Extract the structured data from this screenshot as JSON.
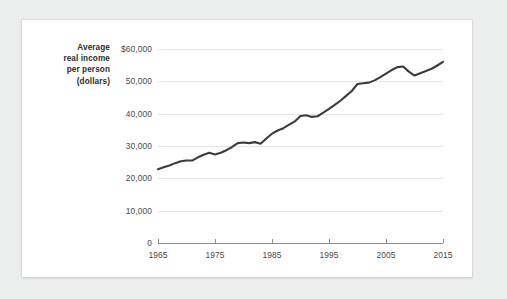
{
  "figure": {
    "axis_label_lines": [
      "Average",
      "real income",
      "per person",
      "(dollars)"
    ],
    "axis_label_text": "Average real income per person (dollars)",
    "line_color": "#3c3c3c",
    "grid_color": "#e6e6e6",
    "axis_color": "#8d8d8d",
    "paper_color": "#ffffff",
    "background_color": "#eceeed"
  },
  "chart_data": {
    "type": "line",
    "title": "",
    "xlabel": "",
    "ylabel": "Average real income per person (dollars)",
    "xlim": [
      1965,
      2015
    ],
    "ylim": [
      0,
      60000
    ],
    "grid": "horizontal",
    "legend": "none",
    "ytick_labels": [
      "$60,000",
      "50,000",
      "40,000",
      "30,000",
      "20,000",
      "10,000",
      "0"
    ],
    "ytick_values": [
      60000,
      50000,
      40000,
      30000,
      20000,
      10000,
      0
    ],
    "xtick_labels": [
      "1965",
      "1975",
      "1985",
      "1995",
      "2005",
      "2015"
    ],
    "xtick_values": [
      1965,
      1975,
      1985,
      1995,
      2005,
      2015
    ],
    "series": [
      {
        "name": "Average real income per person",
        "x": [
          1965,
          1966,
          1967,
          1968,
          1969,
          1970,
          1971,
          1972,
          1973,
          1974,
          1975,
          1976,
          1977,
          1978,
          1979,
          1980,
          1981,
          1982,
          1983,
          1984,
          1985,
          1986,
          1987,
          1988,
          1989,
          1990,
          1991,
          1992,
          1993,
          1994,
          1995,
          1996,
          1997,
          1998,
          1999,
          2000,
          2001,
          2002,
          2003,
          2004,
          2005,
          2006,
          2007,
          2008,
          2009,
          2010,
          2011,
          2012,
          2013,
          2014,
          2015
        ],
        "values": [
          22800,
          23400,
          24000,
          24700,
          25300,
          25500,
          25500,
          26500,
          27300,
          27900,
          27400,
          27900,
          28700,
          29700,
          30900,
          31100,
          30900,
          31200,
          30700,
          32300,
          33800,
          34800,
          35500,
          36600,
          37600,
          39300,
          39500,
          39000,
          39200,
          40300,
          41500,
          42700,
          44000,
          45500,
          47000,
          49200,
          49400,
          49600,
          50300,
          51300,
          52400,
          53500,
          54400,
          54600,
          53000,
          51800,
          52500,
          53200,
          53900,
          54900,
          56000
        ]
      }
    ]
  }
}
